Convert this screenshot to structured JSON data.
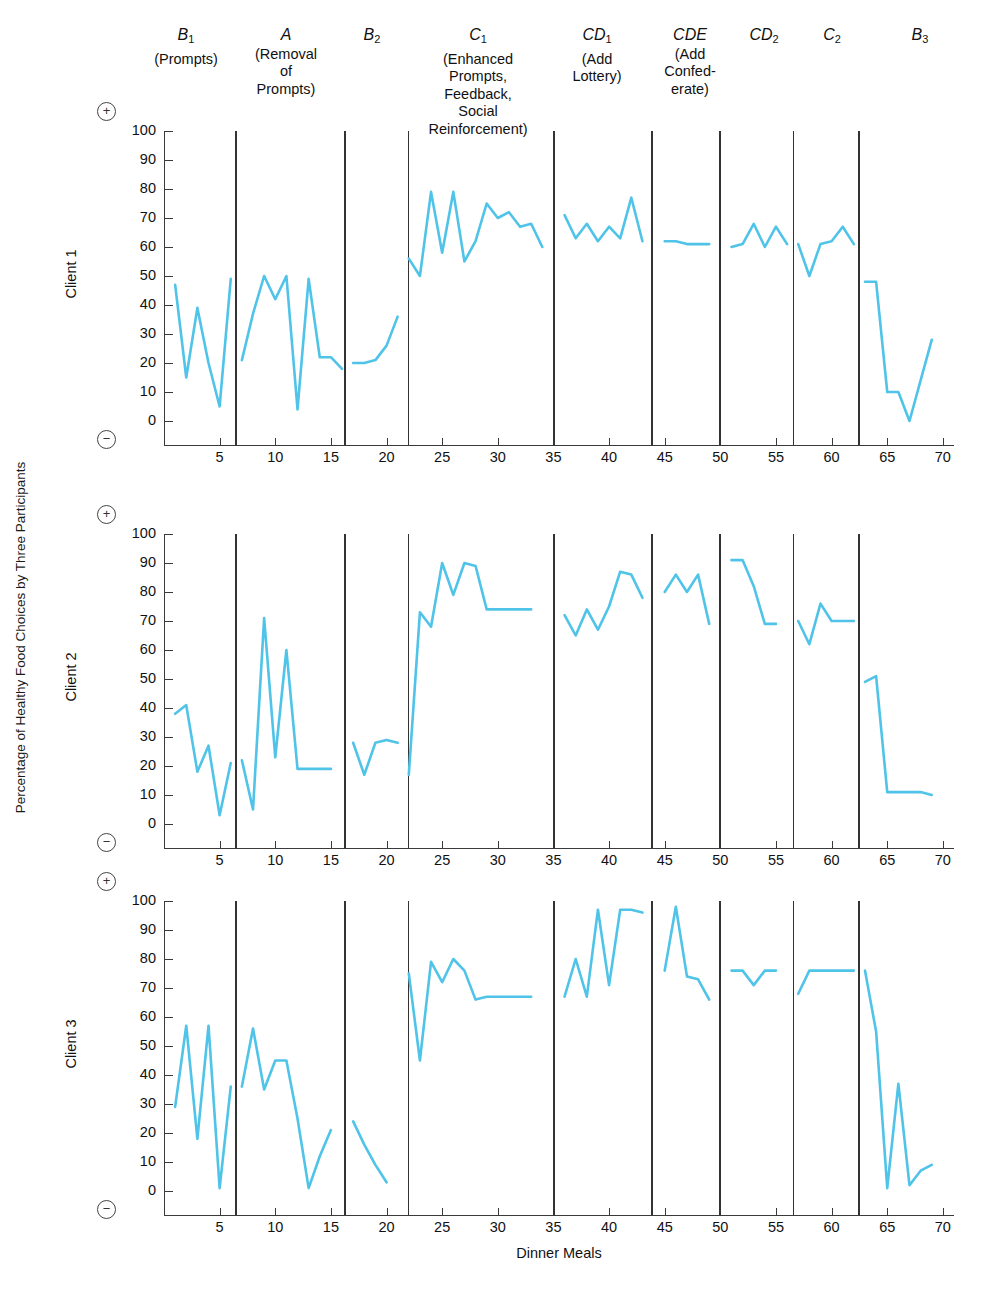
{
  "figure": {
    "ylabel": "Percentage of Healthy Food Choices by Three Participants",
    "xlabel": "Dinner Meals",
    "line_color": "#4FC3E8",
    "axis_color": "#3a3a3a",
    "plus_symbol": "+",
    "minus_symbol": "−"
  },
  "phases": [
    {
      "code": "B",
      "sub": "1",
      "desc": "(Prompts)",
      "center_x": 186,
      "width": 130,
      "divider_x": 231
    },
    {
      "code": "A",
      "sub": "",
      "desc": "(Removal\nof\nPrompts)",
      "center_x": 286,
      "width": 120,
      "divider_x": 340
    },
    {
      "code": "B",
      "sub": "2",
      "desc": "",
      "center_x": 372,
      "width": 80,
      "divider_x": 404
    },
    {
      "code": "C",
      "sub": "1",
      "desc": "(Enhanced\nPrompts,\nFeedback,\nSocial\nReinforcement)",
      "center_x": 478,
      "width": 160,
      "divider_x": 554
    },
    {
      "code": "CD",
      "sub": "1",
      "desc": "(Add\nLottery)",
      "center_x": 597,
      "width": 96,
      "divider_x": 657
    },
    {
      "code": "CDE",
      "sub": "",
      "desc": "(Add\nConfed-\nerate)",
      "center_x": 690,
      "width": 88,
      "divider_x": 728
    },
    {
      "code": "CD",
      "sub": "2",
      "desc": "",
      "center_x": 764,
      "width": 80,
      "divider_x": 800
    },
    {
      "code": "C",
      "sub": "2",
      "desc": "",
      "center_x": 832,
      "width": 80,
      "divider_x": 872
    },
    {
      "code": "B",
      "sub": "3",
      "desc": "",
      "center_x": 920,
      "width": 80,
      "divider_x": null
    }
  ],
  "axes": {
    "yticks": [
      0,
      10,
      20,
      30,
      40,
      50,
      60,
      70,
      80,
      90,
      100
    ],
    "ylim": [
      0,
      100
    ],
    "xticks": [
      5,
      10,
      15,
      20,
      25,
      30,
      35,
      40,
      45,
      50,
      55,
      60,
      65,
      70
    ],
    "xlim": [
      0,
      71
    ]
  },
  "chart_data": {
    "type": "line",
    "title": "",
    "xlabel": "Dinner Meals",
    "ylabel": "Percentage of Healthy Food Choices by Three Participants",
    "xlim": [
      0,
      71
    ],
    "ylim": [
      0,
      100
    ],
    "grid": false,
    "legend": "none",
    "phase_labels": [
      "B1 (Prompts)",
      "A (Removal of Prompts)",
      "B2",
      "C1 (Enhanced Prompts, Feedback, Social Reinforcement)",
      "CD1 (Add Lottery)",
      "CDE (Add Confederate)",
      "CD2",
      "C2",
      "B3"
    ],
    "phase_divider_x": [
      6.4,
      16.2,
      21.9,
      35.0,
      43.8,
      49.9,
      56.5,
      62.4
    ],
    "panels": [
      {
        "name": "Client 1",
        "segments": [
          {
            "phase": "B1",
            "x": [
              1,
              2,
              3,
              4,
              5,
              6
            ],
            "y": [
              47,
              15,
              39,
              20,
              5,
              49
            ]
          },
          {
            "phase": "A",
            "x": [
              7,
              8,
              9,
              10,
              11,
              12,
              13,
              14,
              15,
              16
            ],
            "y": [
              21,
              37,
              50,
              42,
              50,
              4,
              49,
              22,
              22,
              18
            ]
          },
          {
            "phase": "B2",
            "x": [
              17,
              18,
              19,
              20,
              21
            ],
            "y": [
              20,
              20,
              21,
              26,
              36
            ]
          },
          {
            "phase": "C1",
            "x": [
              22,
              23,
              24,
              25,
              26,
              27,
              28,
              29,
              30,
              31,
              32,
              33,
              34
            ],
            "y": [
              56,
              50,
              79,
              58,
              79,
              55,
              62,
              75,
              70,
              72,
              67,
              68,
              60
            ]
          },
          {
            "phase": "CD1",
            "x": [
              36,
              37,
              38,
              39,
              40,
              41,
              42,
              43
            ],
            "y": [
              71,
              63,
              68,
              62,
              67,
              63,
              77,
              62
            ]
          },
          {
            "phase": "CDE",
            "x": [
              45,
              46,
              47,
              48,
              49
            ],
            "y": [
              62,
              62,
              61,
              61,
              61
            ]
          },
          {
            "phase": "CD2",
            "x": [
              51,
              52,
              53,
              54,
              55,
              56
            ],
            "y": [
              60,
              61,
              68,
              60,
              67,
              61
            ]
          },
          {
            "phase": "C2",
            "x": [
              57,
              58,
              59,
              60,
              61,
              62
            ],
            "y": [
              61,
              50,
              61,
              62,
              67,
              61
            ]
          },
          {
            "phase": "B3",
            "x": [
              63,
              64,
              65,
              66,
              67,
              68,
              69
            ],
            "y": [
              48,
              48,
              10,
              10,
              0,
              14,
              28
            ]
          }
        ]
      },
      {
        "name": "Client 2",
        "segments": [
          {
            "phase": "B1",
            "x": [
              1,
              2,
              3,
              4,
              5,
              6
            ],
            "y": [
              38,
              41,
              18,
              27,
              3,
              21
            ]
          },
          {
            "phase": "A",
            "x": [
              7,
              8,
              9,
              10,
              11,
              12,
              13,
              14,
              15
            ],
            "y": [
              22,
              5,
              71,
              23,
              60,
              19,
              19,
              19,
              19
            ]
          },
          {
            "phase": "B2",
            "x": [
              17,
              18,
              19,
              20,
              21
            ],
            "y": [
              28,
              17,
              28,
              29,
              28
            ]
          },
          {
            "phase": "C1",
            "x": [
              22,
              23,
              24,
              25,
              26,
              27,
              28,
              29,
              30,
              31,
              32,
              33
            ],
            "y": [
              17,
              73,
              68,
              90,
              79,
              90,
              89,
              74,
              74,
              74,
              74,
              74
            ]
          },
          {
            "phase": "CD1",
            "x": [
              36,
              37,
              38,
              39,
              40,
              41,
              42,
              43
            ],
            "y": [
              72,
              65,
              74,
              67,
              75,
              87,
              86,
              78
            ]
          },
          {
            "phase": "CDE",
            "x": [
              45,
              46,
              47,
              48,
              49
            ],
            "y": [
              80,
              86,
              80,
              86,
              69
            ]
          },
          {
            "phase": "CD2",
            "x": [
              51,
              52,
              53,
              54,
              55
            ],
            "y": [
              91,
              91,
              82,
              69,
              69
            ]
          },
          {
            "phase": "C2",
            "x": [
              57,
              58,
              59,
              60,
              61,
              62
            ],
            "y": [
              70,
              62,
              76,
              70,
              70,
              70
            ]
          },
          {
            "phase": "B3",
            "x": [
              63,
              64,
              65,
              66,
              67,
              68,
              69
            ],
            "y": [
              49,
              51,
              11,
              11,
              11,
              11,
              10
            ]
          }
        ]
      },
      {
        "name": "Client 3",
        "segments": [
          {
            "phase": "B1",
            "x": [
              1,
              2,
              3,
              4,
              5,
              6
            ],
            "y": [
              29,
              57,
              18,
              57,
              1,
              36
            ]
          },
          {
            "phase": "A",
            "x": [
              7,
              8,
              9,
              10,
              11,
              12,
              13,
              14,
              15
            ],
            "y": [
              36,
              56,
              35,
              45,
              45,
              25,
              1,
              12,
              21
            ]
          },
          {
            "phase": "B2",
            "x": [
              17,
              18,
              19,
              20
            ],
            "y": [
              24,
              16,
              9,
              3
            ]
          },
          {
            "phase": "C1",
            "x": [
              22,
              23,
              24,
              25,
              26,
              27,
              28,
              29,
              30,
              31,
              32,
              33
            ],
            "y": [
              75,
              45,
              79,
              72,
              80,
              76,
              66,
              67,
              67,
              67,
              67,
              67
            ]
          },
          {
            "phase": "CD1",
            "x": [
              36,
              37,
              38,
              39,
              40,
              41,
              42,
              43
            ],
            "y": [
              67,
              80,
              67,
              97,
              71,
              97,
              97,
              96
            ]
          },
          {
            "phase": "CDE",
            "x": [
              45,
              46,
              47,
              48,
              49
            ],
            "y": [
              76,
              98,
              74,
              73,
              66
            ]
          },
          {
            "phase": "CD2",
            "x": [
              51,
              52,
              53,
              54,
              55
            ],
            "y": [
              76,
              76,
              71,
              76,
              76
            ]
          },
          {
            "phase": "C2",
            "x": [
              57,
              58,
              59,
              60,
              61,
              62
            ],
            "y": [
              68,
              76,
              76,
              76,
              76,
              76
            ]
          },
          {
            "phase": "B3",
            "x": [
              63,
              64,
              65,
              66,
              67,
              68,
              69
            ],
            "y": [
              76,
              55,
              1,
              37,
              2,
              7,
              9
            ]
          }
        ]
      }
    ]
  }
}
